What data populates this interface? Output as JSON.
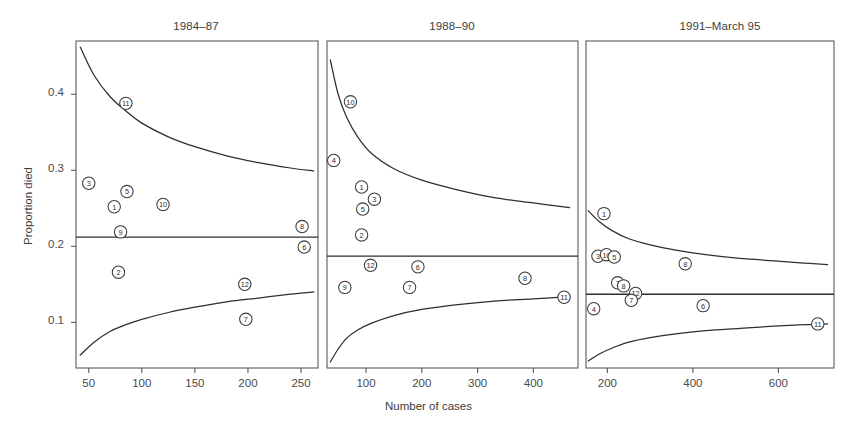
{
  "figure": {
    "xlabel": "Number of cases",
    "ylabel": "Proportion died",
    "width": 854,
    "height": 432,
    "ink_color": "#2e2e2e",
    "frame_color": "#5a5a5a"
  },
  "chart_data": {
    "type": "scatter",
    "title": "",
    "xlabel": "Number of cases",
    "ylabel": "Proportion died",
    "grid": false,
    "legend": "none",
    "ylim": [
      0.04,
      0.47
    ],
    "yticks": [
      0.1,
      0.2,
      0.3,
      0.4
    ],
    "ytick_labels": [
      "0.1",
      "0.2",
      "0.3",
      "0.4"
    ],
    "panel_layout": "three side-by-side panels sharing a common y axis",
    "annotation": "Each marker is a numbered circle identifying an institution; the middle horizontal line is the overall proportion died and the upper/lower curves are funnel-plot control limits.",
    "panels": [
      {
        "title": "1984–87",
        "xlim": [
          38,
          266
        ],
        "xticks": [
          50,
          100,
          150,
          200,
          250
        ],
        "xtick_labels": [
          "50",
          "100",
          "150",
          "200",
          "250"
        ],
        "reference_line": 0.212,
        "points": [
          {
            "label": "3",
            "x": 50,
            "y": 0.283
          },
          {
            "label": "11",
            "x": 85,
            "y": 0.388
          },
          {
            "label": "5",
            "x": 86,
            "y": 0.272
          },
          {
            "label": "1",
            "x": 74,
            "y": 0.252
          },
          {
            "label": "10",
            "x": 120,
            "y": 0.255
          },
          {
            "label": "9",
            "x": 80,
            "y": 0.219
          },
          {
            "label": "8",
            "x": 251,
            "y": 0.226
          },
          {
            "label": "6",
            "x": 253,
            "y": 0.199
          },
          {
            "label": "2",
            "x": 78,
            "y": 0.166
          },
          {
            "label": "12",
            "x": 197,
            "y": 0.15
          },
          {
            "label": "7",
            "x": 198,
            "y": 0.104
          }
        ],
        "upper_limit_curve": [
          {
            "x": 42,
            "y": 0.462
          },
          {
            "x": 55,
            "y": 0.425
          },
          {
            "x": 70,
            "y": 0.397
          },
          {
            "x": 85,
            "y": 0.378
          },
          {
            "x": 100,
            "y": 0.362
          },
          {
            "x": 125,
            "y": 0.344
          },
          {
            "x": 150,
            "y": 0.331
          },
          {
            "x": 180,
            "y": 0.319
          },
          {
            "x": 210,
            "y": 0.31
          },
          {
            "x": 240,
            "y": 0.303
          },
          {
            "x": 262,
            "y": 0.299
          }
        ],
        "lower_limit_curve": [
          {
            "x": 42,
            "y": 0.057
          },
          {
            "x": 55,
            "y": 0.074
          },
          {
            "x": 70,
            "y": 0.088
          },
          {
            "x": 85,
            "y": 0.097
          },
          {
            "x": 100,
            "y": 0.104
          },
          {
            "x": 125,
            "y": 0.113
          },
          {
            "x": 150,
            "y": 0.12
          },
          {
            "x": 180,
            "y": 0.127
          },
          {
            "x": 210,
            "y": 0.132
          },
          {
            "x": 240,
            "y": 0.137
          },
          {
            "x": 262,
            "y": 0.14
          }
        ]
      },
      {
        "title": "1988–90",
        "xlim": [
          30,
          480
        ],
        "xticks": [
          100,
          200,
          300,
          400
        ],
        "xtick_labels": [
          "100",
          "200",
          "300",
          "400"
        ],
        "reference_line": 0.187,
        "points": [
          {
            "label": "10",
            "x": 72,
            "y": 0.39
          },
          {
            "label": "4",
            "x": 42,
            "y": 0.313
          },
          {
            "label": "1",
            "x": 92,
            "y": 0.278
          },
          {
            "label": "3",
            "x": 115,
            "y": 0.262
          },
          {
            "label": "5",
            "x": 94,
            "y": 0.249
          },
          {
            "label": "2",
            "x": 92,
            "y": 0.215
          },
          {
            "label": "12",
            "x": 108,
            "y": 0.175
          },
          {
            "label": "6",
            "x": 193,
            "y": 0.173
          },
          {
            "label": "8",
            "x": 385,
            "y": 0.158
          },
          {
            "label": "9",
            "x": 62,
            "y": 0.146
          },
          {
            "label": "7",
            "x": 178,
            "y": 0.146
          },
          {
            "label": "11",
            "x": 455,
            "y": 0.133
          }
        ],
        "upper_limit_curve": [
          {
            "x": 36,
            "y": 0.445
          },
          {
            "x": 50,
            "y": 0.4
          },
          {
            "x": 65,
            "y": 0.37
          },
          {
            "x": 85,
            "y": 0.344
          },
          {
            "x": 110,
            "y": 0.322
          },
          {
            "x": 150,
            "y": 0.302
          },
          {
            "x": 200,
            "y": 0.287
          },
          {
            "x": 260,
            "y": 0.275
          },
          {
            "x": 330,
            "y": 0.264
          },
          {
            "x": 400,
            "y": 0.257
          },
          {
            "x": 465,
            "y": 0.251
          }
        ],
        "lower_limit_curve": [
          {
            "x": 36,
            "y": 0.048
          },
          {
            "x": 50,
            "y": 0.065
          },
          {
            "x": 65,
            "y": 0.079
          },
          {
            "x": 85,
            "y": 0.09
          },
          {
            "x": 110,
            "y": 0.099
          },
          {
            "x": 150,
            "y": 0.109
          },
          {
            "x": 200,
            "y": 0.117
          },
          {
            "x": 260,
            "y": 0.123
          },
          {
            "x": 330,
            "y": 0.128
          },
          {
            "x": 400,
            "y": 0.131
          },
          {
            "x": 465,
            "y": 0.134
          }
        ]
      },
      {
        "title": "1991–March 95",
        "xlim": [
          150,
          730
        ],
        "xticks": [
          200,
          400,
          600
        ],
        "xtick_labels": [
          "200",
          "400",
          "600"
        ],
        "reference_line": 0.137,
        "points": [
          {
            "label": "1",
            "x": 192,
            "y": 0.243
          },
          {
            "label": "3",
            "x": 178,
            "y": 0.187
          },
          {
            "label": "10",
            "x": 198,
            "y": 0.189
          },
          {
            "label": "5",
            "x": 216,
            "y": 0.186
          },
          {
            "label": "8",
            "x": 382,
            "y": 0.177
          },
          {
            "label": "7",
            "x": 224,
            "y": 0.152
          },
          {
            "label": "8",
            "x": 238,
            "y": 0.148
          },
          {
            "label": "12",
            "x": 266,
            "y": 0.138
          },
          {
            "label": "7",
            "x": 256,
            "y": 0.129
          },
          {
            "label": "4",
            "x": 168,
            "y": 0.118
          },
          {
            "label": "6",
            "x": 424,
            "y": 0.122
          },
          {
            "label": "11",
            "x": 692,
            "y": 0.098
          }
        ],
        "upper_limit_curve": [
          {
            "x": 155,
            "y": 0.247
          },
          {
            "x": 180,
            "y": 0.233
          },
          {
            "x": 210,
            "y": 0.221
          },
          {
            "x": 250,
            "y": 0.21
          },
          {
            "x": 300,
            "y": 0.202
          },
          {
            "x": 360,
            "y": 0.195
          },
          {
            "x": 430,
            "y": 0.189
          },
          {
            "x": 510,
            "y": 0.184
          },
          {
            "x": 590,
            "y": 0.181
          },
          {
            "x": 660,
            "y": 0.178
          },
          {
            "x": 715,
            "y": 0.176
          }
        ],
        "lower_limit_curve": [
          {
            "x": 155,
            "y": 0.049
          },
          {
            "x": 180,
            "y": 0.058
          },
          {
            "x": 210,
            "y": 0.066
          },
          {
            "x": 250,
            "y": 0.074
          },
          {
            "x": 300,
            "y": 0.08
          },
          {
            "x": 360,
            "y": 0.085
          },
          {
            "x": 430,
            "y": 0.089
          },
          {
            "x": 510,
            "y": 0.092
          },
          {
            "x": 590,
            "y": 0.095
          },
          {
            "x": 660,
            "y": 0.097
          },
          {
            "x": 715,
            "y": 0.098
          }
        ]
      }
    ]
  }
}
